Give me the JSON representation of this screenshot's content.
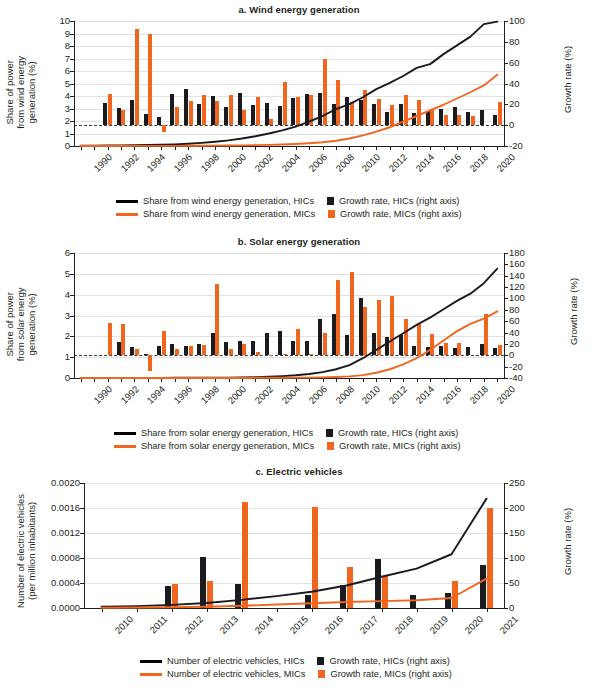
{
  "figure": {
    "cut_off_top_title": "Share of power generation from renewables and electric vehicles",
    "colors": {
      "hic": "#1b1b1f",
      "mic": "#f0661f",
      "grid": "#e2e2e2",
      "axis": "#231f20"
    }
  },
  "panels": [
    {
      "id": "a",
      "title": "a. Wind energy generation",
      "ylabel": "Share of power\nfrom wind energy\ngeneration (%)",
      "ylabel_right": "Growth rate (%)",
      "legend": [
        {
          "type": "line",
          "series": "hic",
          "label": "Share from wind energy generation, HICs"
        },
        {
          "type": "square",
          "series": "hic",
          "label": "Growth rate, HICs (right axis)"
        },
        {
          "type": "line",
          "series": "mic",
          "label": "Share from wind energy generation, MICs"
        },
        {
          "type": "square",
          "series": "mic",
          "label": "Growth rate, MICs (right axis)"
        }
      ]
    },
    {
      "id": "b",
      "title": "b. Solar energy generation",
      "ylabel": "Share of power\nfrom solar energy\ngeneration (%)",
      "ylabel_right": "Growth rate (%)",
      "legend": [
        {
          "type": "line",
          "series": "hic",
          "label": "Share from solar energy generation, HICs"
        },
        {
          "type": "square",
          "series": "hic",
          "label": "Growth rate, HICs (right axis)"
        },
        {
          "type": "line",
          "series": "mic",
          "label": "Share from solar energy generation, MICs"
        },
        {
          "type": "square",
          "series": "mic",
          "label": "Growth rate, MICs (right axis)"
        }
      ]
    },
    {
      "id": "c",
      "title": "c. Electric vehicles",
      "ylabel": "Number of electric vehicles\n(per million inhabitants)",
      "ylabel_right": "Growth rate (%)",
      "legend": [
        {
          "type": "line",
          "series": "hic",
          "label": "Number of electric vehicles, HICs"
        },
        {
          "type": "square",
          "series": "hic",
          "label": "Growth rate, HICs (right axis)"
        },
        {
          "type": "line",
          "series": "mic",
          "label": "Number of electric vehicles, MICs"
        },
        {
          "type": "square",
          "series": "mic",
          "label": "Growth rate, MICs (right axis)"
        }
      ]
    }
  ],
  "chart_data": [
    {
      "type": "bar",
      "panel": "a",
      "title": "a. Wind energy generation",
      "xlabel": "",
      "ylabel": "Share of power from wind energy generation (%)",
      "ylabel_right": "Growth rate (%)",
      "ylim": [
        0,
        10
      ],
      "ylim_right": [
        -20,
        100
      ],
      "yticks": [
        0,
        1,
        2,
        3,
        4,
        5,
        6,
        7,
        8,
        9,
        10
      ],
      "yticks_right": [
        -20,
        0,
        20,
        40,
        60,
        80,
        100
      ],
      "grid": true,
      "x": [
        1990,
        1991,
        1992,
        1993,
        1994,
        1995,
        1996,
        1997,
        1998,
        1999,
        2000,
        2001,
        2002,
        2003,
        2004,
        2005,
        2006,
        2007,
        2008,
        2009,
        2010,
        2011,
        2012,
        2013,
        2014,
        2015,
        2016,
        2017,
        2018,
        2019,
        2020,
        2021
      ],
      "xtick_labels": [
        "1990",
        "1992",
        "1994",
        "1996",
        "1998",
        "2000",
        "2002",
        "2004",
        "2006",
        "2008",
        "2010",
        "2012",
        "2014",
        "2016",
        "2018",
        "2020"
      ],
      "series": [
        {
          "name": "Share from wind energy generation, HICs",
          "kind": "line",
          "axis": "left",
          "color": "#1b1b1f",
          "values": [
            0.02,
            0.03,
            0.04,
            0.05,
            0.06,
            0.08,
            0.1,
            0.13,
            0.18,
            0.25,
            0.34,
            0.45,
            0.6,
            0.78,
            1.0,
            1.25,
            1.55,
            1.95,
            2.4,
            2.95,
            3.35,
            3.9,
            4.55,
            5.05,
            5.6,
            6.25,
            6.55,
            7.35,
            8.05,
            8.75,
            9.75,
            9.95
          ]
        },
        {
          "name": "Share from wind energy generation, MICs",
          "kind": "line",
          "axis": "left",
          "color": "#f0661f",
          "values": [
            0.0,
            0.0,
            0.0,
            0.0,
            0.01,
            0.01,
            0.01,
            0.01,
            0.02,
            0.02,
            0.03,
            0.04,
            0.05,
            0.07,
            0.09,
            0.12,
            0.16,
            0.22,
            0.3,
            0.42,
            0.6,
            0.85,
            1.15,
            1.5,
            1.95,
            2.4,
            2.85,
            3.3,
            3.8,
            4.3,
            4.85,
            5.7
          ]
        },
        {
          "name": "Growth rate, HICs (right axis)",
          "kind": "bar",
          "axis": "right",
          "color": "#1b1b1f",
          "values": [
            null,
            null,
            21.5,
            16.5,
            24.0,
            11.0,
            7.5,
            29.5,
            34.5,
            20.0,
            28.0,
            17.5,
            30.5,
            19.5,
            21.0,
            18.0,
            26.5,
            30.0,
            31.0,
            20.5,
            27.0,
            24.5,
            20.0,
            12.5,
            20.0,
            11.5,
            14.0,
            15.5,
            17.5,
            13.0,
            14.5,
            9.5
          ]
        },
        {
          "name": "Growth rate, MICs (right axis)",
          "kind": "bar",
          "axis": "right",
          "color": "#f0661f",
          "values": [
            null,
            null,
            29.5,
            14.5,
            92.0,
            88.0,
            -6.5,
            17.5,
            23.5,
            28.5,
            23.0,
            28.5,
            14.5,
            27.0,
            6.0,
            41.5,
            27.5,
            28.5,
            63.5,
            43.5,
            22.5,
            33.5,
            25.0,
            19.5,
            29.0,
            24.5,
            16.0,
            9.5,
            10.0,
            9.0,
            null,
            22.5
          ]
        }
      ]
    },
    {
      "type": "bar",
      "panel": "b",
      "title": "b. Solar energy generation",
      "xlabel": "",
      "ylabel": "Share of power from solar energy generation (%)",
      "ylabel_right": "Growth rate (%)",
      "ylim": [
        0,
        6
      ],
      "ylim_right": [
        -40,
        180
      ],
      "yticks": [
        0,
        1,
        2,
        3,
        4,
        5,
        6
      ],
      "yticks_right": [
        -40,
        -20,
        0,
        20,
        40,
        60,
        80,
        100,
        120,
        140,
        160,
        180
      ],
      "grid": true,
      "x": [
        1990,
        1991,
        1992,
        1993,
        1994,
        1995,
        1996,
        1997,
        1998,
        1999,
        2000,
        2001,
        2002,
        2003,
        2004,
        2005,
        2006,
        2007,
        2008,
        2009,
        2010,
        2011,
        2012,
        2013,
        2014,
        2015,
        2016,
        2017,
        2018,
        2019,
        2020,
        2021
      ],
      "xtick_labels": [
        "1990",
        "1992",
        "1994",
        "1996",
        "1998",
        "2000",
        "2002",
        "2004",
        "2006",
        "2008",
        "2010",
        "2012",
        "2014",
        "2016",
        "2018",
        "2020"
      ],
      "series": [
        {
          "name": "Share from solar energy generation, HICs",
          "kind": "line",
          "axis": "left",
          "color": "#1b1b1f",
          "values": [
            0.0,
            0.0,
            0.0,
            0.0,
            0.0,
            0.0,
            0.0,
            0.01,
            0.01,
            0.01,
            0.02,
            0.02,
            0.03,
            0.04,
            0.06,
            0.09,
            0.13,
            0.19,
            0.28,
            0.42,
            0.62,
            0.95,
            1.35,
            1.75,
            2.15,
            2.55,
            2.9,
            3.3,
            3.7,
            4.05,
            4.55,
            5.25
          ]
        },
        {
          "name": "Share from solar energy generation, MICs",
          "kind": "line",
          "axis": "left",
          "color": "#f0661f",
          "values": [
            0.0,
            0.0,
            0.0,
            0.0,
            0.0,
            0.0,
            0.0,
            0.0,
            0.0,
            0.0,
            0.0,
            0.0,
            0.0,
            0.01,
            0.01,
            0.01,
            0.02,
            0.02,
            0.03,
            0.05,
            0.08,
            0.14,
            0.25,
            0.42,
            0.65,
            0.95,
            1.35,
            1.8,
            2.25,
            2.6,
            2.85,
            3.2
          ]
        },
        {
          "name": "Growth rate, HICs (right axis)",
          "kind": "bar",
          "axis": "right",
          "color": "#1b1b1f",
          "values": [
            null,
            null,
            0.0,
            24.0,
            14.0,
            1.5,
            16.5,
            20.0,
            17.0,
            20.0,
            38.5,
            23.5,
            24.5,
            25.0,
            38.5,
            43.5,
            25.0,
            26.0,
            64.5,
            73.5,
            36.5,
            101.5,
            40.0,
            32.0,
            36.0,
            16.0,
            15.0,
            15.5,
            13.0,
            15.0,
            20.5,
            13.5
          ]
        },
        {
          "name": "Growth rate, MICs (right axis)",
          "kind": "bar",
          "axis": "right",
          "color": "#f0661f",
          "values": [
            null,
            null,
            57.0,
            55.5,
            10.5,
            -28.5,
            43.5,
            11.0,
            17.0,
            17.5,
            125.0,
            11.0,
            19.5,
            5.5,
            -1.5,
            2.0,
            47.0,
            2.0,
            40.0,
            133.0,
            147.0,
            85.0,
            98.0,
            105.0,
            63.0,
            55.5,
            37.0,
            22.0,
            22.0,
            null,
            73.0,
            18.0
          ]
        }
      ]
    },
    {
      "type": "bar",
      "panel": "c",
      "title": "c. Electric vehicles",
      "xlabel": "",
      "ylabel": "Number of electric vehicles (per million inhabitants)",
      "ylabel_right": "Growth rate (%)",
      "ylim": [
        0,
        0.002
      ],
      "ylim_right": [
        0,
        250
      ],
      "yticks": [
        0.0,
        0.0004,
        0.0008,
        0.0012,
        0.0016,
        0.002
      ],
      "ytick_labels": [
        "0.0000",
        "0.0004",
        "0.0008",
        "0.0012",
        "0.0016",
        "0.0020"
      ],
      "yticks_right": [
        0,
        50,
        100,
        150,
        200,
        250
      ],
      "grid": true,
      "x": [
        2010,
        2011,
        2012,
        2013,
        2014,
        2015,
        2016,
        2017,
        2018,
        2019,
        2020,
        2021
      ],
      "xtick_labels": [
        "2010",
        "2011",
        "2012",
        "2013",
        "2014",
        "2015",
        "2016",
        "2017",
        "2018",
        "2019",
        "2020",
        "2021"
      ],
      "series": [
        {
          "name": "Number of electric vehicles, HICs",
          "kind": "line",
          "axis": "left",
          "color": "#1b1b1f",
          "values": [
            2e-05,
            3e-05,
            5e-05,
            8e-05,
            0.00013,
            0.00019,
            0.00026,
            0.00036,
            0.0005,
            0.00063,
            0.00086,
            0.00175
          ]
        },
        {
          "name": "Number of electric vehicles, MICs",
          "kind": "line",
          "axis": "left",
          "color": "#f0661f",
          "values": [
            5e-06,
            8e-06,
            1.2e-05,
            2e-05,
            3.5e-05,
            5.5e-05,
            7.5e-05,
            9.5e-05,
            0.00011,
            0.000125,
            0.00016,
            0.00047
          ]
        },
        {
          "name": "Growth rate, HICs (right axis)",
          "kind": "bar",
          "axis": "right",
          "color": "#1b1b1f",
          "values": [
            null,
            null,
            45.0,
            102.0,
            49.0,
            null,
            27.0,
            46.0,
            99.0,
            26.0,
            30.0,
            87.0
          ]
        },
        {
          "name": "Growth rate, MICs (right axis)",
          "kind": "bar",
          "axis": "right",
          "color": "#f0661f",
          "values": [
            null,
            null,
            48.0,
            55.0,
            212.0,
            null,
            202.0,
            83.0,
            65.0,
            null,
            55.0,
            200.0
          ]
        }
      ]
    }
  ]
}
